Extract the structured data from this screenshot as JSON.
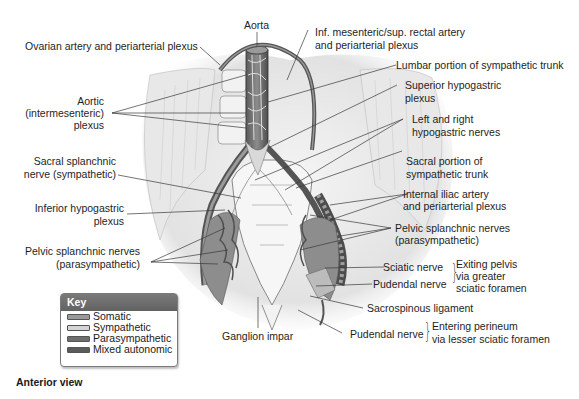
{
  "figure": {
    "caption": "Anterior view",
    "labels": {
      "aorta": "Aorta",
      "ovarian": "Ovarian artery and periarterial plexus",
      "inf_mesenteric_1": "Inf. mesenteric/sup. rectal artery",
      "inf_mesenteric_2": "and periarterial plexus",
      "lumbar": "Lumbar portion of sympathetic trunk",
      "aortic_1": "Aortic",
      "aortic_2": "(intermesenteric)",
      "aortic_3": "plexus",
      "sup_hypo_1": "Superior hypogastric",
      "sup_hypo_2": "plexus",
      "lr_hypo_1": "Left and right",
      "lr_hypo_2": "hypogastric nerves",
      "sacral_splanch_1": "Sacral splanchnic",
      "sacral_splanch_2": "nerve (sympathetic)",
      "sacral_portion_1": "Sacral portion of",
      "sacral_portion_2": "sympathetic trunk",
      "int_iliac_1": "Internal iliac artery",
      "int_iliac_2": "and periarterial plexus",
      "inf_hypo_1": "Inferior hypogastric",
      "inf_hypo_2": "plexus",
      "pelvic_left_1": "Pelvic splanchnic nerves",
      "pelvic_left_2": "(parasympathetic)",
      "pelvic_right_1": "Pelvic splanchnic nerves",
      "pelvic_right_2": "(parasympathetic)",
      "sciatic": "Sciatic nerve",
      "pudendal_1": "Pudendal nerve",
      "exiting_1": "Exiting pelvis",
      "exiting_2": "via greater",
      "exiting_3": "sciatic foramen",
      "sacrospinous": "Sacrospinous ligament",
      "ganglion": "Ganglion impar",
      "pudendal_2": "Pudendal nerve",
      "entering_1": "Entering perineum",
      "entering_2": "via lesser sciatic foramen"
    },
    "key": {
      "title": "Key",
      "items": [
        {
          "label": "Somatic",
          "color": "#9a9a9a"
        },
        {
          "label": "Sympathetic",
          "color": "#d4d4d4"
        },
        {
          "label": "Parasympathetic",
          "color": "#6f6f6f"
        },
        {
          "label": "Mixed autonomic",
          "color": "#5a5a5a"
        }
      ]
    }
  }
}
